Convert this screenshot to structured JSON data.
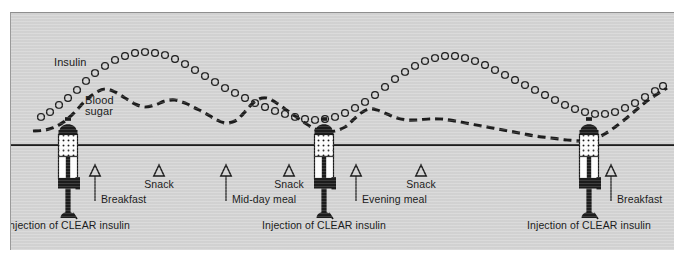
{
  "figure": {
    "background_color": "#d5d5d5",
    "ink_color": "#1c1c1c"
  },
  "curve_labels": {
    "insulin": "Insulin",
    "blood_sugar_line1": "Blood",
    "blood_sugar_line2": "sugar"
  },
  "events": [
    {
      "id": "breakfast-1",
      "label": "Breakfast",
      "type": "meal",
      "x": 84
    },
    {
      "id": "snack-1",
      "label": "Snack",
      "type": "snack",
      "x": 148
    },
    {
      "id": "midday",
      "label": "Mid-day meal",
      "type": "meal",
      "x": 215
    },
    {
      "id": "snack-2",
      "label": "Snack",
      "type": "snack",
      "x": 278
    },
    {
      "id": "evening",
      "label": "Evening meal",
      "type": "meal",
      "x": 345
    },
    {
      "id": "snack-3",
      "label": "Snack",
      "type": "snack",
      "x": 410
    },
    {
      "id": "breakfast-2",
      "label": "Breakfast",
      "type": "meal",
      "x": 600
    }
  ],
  "injections": [
    {
      "id": "injection-1",
      "label": "Injection of CLEAR insulin",
      "x": 57
    },
    {
      "id": "injection-2",
      "label": "Injection of CLEAR insulin",
      "x": 313
    },
    {
      "id": "injection-3",
      "label": "Injection of CLEAR insulin",
      "x": 578
    }
  ],
  "chart_data": {
    "type": "line",
    "xlabel": "",
    "ylabel": "",
    "grid": false,
    "legend": [
      "Insulin",
      "Blood sugar"
    ],
    "legend_position": "inline-annotation",
    "axis_note": "No numeric axes; qualitative curves over a 24-hour timeline",
    "series": [
      {
        "name": "Insulin",
        "style": "open-circle-markers",
        "points": [
          [
            30,
            104
          ],
          [
            39,
            99
          ],
          [
            48,
            92
          ],
          [
            57,
            85
          ],
          [
            66,
            77
          ],
          [
            75,
            68
          ],
          [
            84,
            60
          ],
          [
            94,
            53
          ],
          [
            104,
            47
          ],
          [
            114,
            43
          ],
          [
            124,
            40
          ],
          [
            134,
            39
          ],
          [
            144,
            40
          ],
          [
            154,
            42
          ],
          [
            164,
            46
          ],
          [
            174,
            51
          ],
          [
            184,
            57
          ],
          [
            194,
            63
          ],
          [
            204,
            69
          ],
          [
            214,
            75
          ],
          [
            224,
            80
          ],
          [
            234,
            85
          ],
          [
            244,
            90
          ],
          [
            254,
            94
          ],
          [
            264,
            98
          ],
          [
            274,
            101
          ],
          [
            284,
            104
          ],
          [
            294,
            106
          ],
          [
            304,
            107
          ],
          [
            314,
            106
          ],
          [
            324,
            104
          ],
          [
            334,
            100
          ],
          [
            344,
            95
          ],
          [
            354,
            89
          ],
          [
            364,
            82
          ],
          [
            374,
            74
          ],
          [
            384,
            66
          ],
          [
            394,
            59
          ],
          [
            404,
            53
          ],
          [
            414,
            48
          ],
          [
            424,
            45
          ],
          [
            434,
            43
          ],
          [
            444,
            43
          ],
          [
            454,
            45
          ],
          [
            464,
            48
          ],
          [
            474,
            52
          ],
          [
            484,
            57
          ],
          [
            494,
            62
          ],
          [
            504,
            67
          ],
          [
            514,
            72
          ],
          [
            524,
            77
          ],
          [
            534,
            82
          ],
          [
            544,
            87
          ],
          [
            554,
            92
          ],
          [
            564,
            96
          ],
          [
            574,
            99
          ],
          [
            584,
            101
          ],
          [
            594,
            101
          ],
          [
            604,
            99
          ],
          [
            614,
            95
          ],
          [
            624,
            90
          ],
          [
            634,
            84
          ],
          [
            644,
            78
          ],
          [
            652,
            73
          ]
        ]
      },
      {
        "name": "Blood sugar",
        "style": "dashed-line",
        "points": [
          [
            22,
            118
          ],
          [
            34,
            117
          ],
          [
            44,
            114
          ],
          [
            54,
            108
          ],
          [
            64,
            99
          ],
          [
            74,
            88
          ],
          [
            84,
            80
          ],
          [
            94,
            76
          ],
          [
            104,
            79
          ],
          [
            114,
            85
          ],
          [
            124,
            91
          ],
          [
            134,
            94
          ],
          [
            144,
            92
          ],
          [
            154,
            88
          ],
          [
            164,
            87
          ],
          [
            174,
            90
          ],
          [
            184,
            95
          ],
          [
            194,
            100
          ],
          [
            204,
            106
          ],
          [
            214,
            110
          ],
          [
            224,
            108
          ],
          [
            232,
            101
          ],
          [
            240,
            92
          ],
          [
            248,
            86
          ],
          [
            256,
            85
          ],
          [
            264,
            89
          ],
          [
            274,
            96
          ],
          [
            284,
            103
          ],
          [
            294,
            110
          ],
          [
            304,
            116
          ],
          [
            314,
            119
          ],
          [
            324,
            118
          ],
          [
            334,
            114
          ],
          [
            342,
            107
          ],
          [
            350,
            100
          ],
          [
            358,
            96
          ],
          [
            366,
            97
          ],
          [
            376,
            101
          ],
          [
            386,
            105
          ],
          [
            396,
            107
          ],
          [
            406,
            107
          ],
          [
            418,
            106
          ],
          [
            430,
            106
          ],
          [
            444,
            108
          ],
          [
            460,
            111
          ],
          [
            476,
            114
          ],
          [
            492,
            117
          ],
          [
            508,
            120
          ],
          [
            524,
            123
          ],
          [
            540,
            125
          ],
          [
            556,
            127
          ],
          [
            570,
            128
          ],
          [
            580,
            127
          ],
          [
            590,
            123
          ],
          [
            600,
            117
          ],
          [
            612,
            108
          ],
          [
            624,
            98
          ],
          [
            636,
            88
          ],
          [
            648,
            80
          ],
          [
            656,
            75
          ]
        ]
      }
    ],
    "timeline": {
      "y": 132,
      "x_start": 0,
      "x_end": 664
    },
    "annotations": [
      {
        "text": "Insulin",
        "x": 44,
        "y": 60
      },
      {
        "text": "Blood sugar",
        "x": 88,
        "y": 95
      },
      {
        "text": "Breakfast",
        "x": 88,
        "y": 180
      },
      {
        "text": "Snack",
        "x": 148,
        "y": 163
      },
      {
        "text": "Mid-day meal",
        "x": 215,
        "y": 180
      },
      {
        "text": "Snack",
        "x": 278,
        "y": 163
      },
      {
        "text": "Evening meal",
        "x": 349,
        "y": 180
      },
      {
        "text": "Snack",
        "x": 410,
        "y": 163
      },
      {
        "text": "Breakfast",
        "x": 604,
        "y": 180
      },
      {
        "text": "Injection of CLEAR insulin",
        "x": 57,
        "y": 213
      },
      {
        "text": "Injection of CLEAR insulin",
        "x": 313,
        "y": 213
      },
      {
        "text": "Injection of CLEAR insulin",
        "x": 578,
        "y": 213
      }
    ]
  }
}
